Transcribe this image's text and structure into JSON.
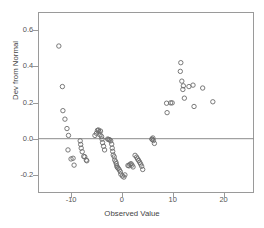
{
  "chart_data": {
    "type": "scatter",
    "title": "",
    "xlabel": "Observed Value",
    "ylabel": "Dev from Normal",
    "xlim": [
      -16.5,
      26.0
    ],
    "ylim": [
      -0.3,
      0.7
    ],
    "xticks": [
      -10,
      0,
      10,
      20
    ],
    "xticklabels": [
      "-10",
      "0",
      "10",
      "20"
    ],
    "yticks": [
      -0.2,
      0.0,
      0.2,
      0.4,
      0.6
    ],
    "yticklabels": [
      "-0.2",
      "0.0",
      "0.2",
      "0.4",
      "0.6"
    ],
    "grid": false,
    "legend": null,
    "reference_lines": [
      {
        "axis": "y",
        "value": 0.0,
        "color": "#8c8c8c"
      }
    ],
    "marker": {
      "shape": "open-circle",
      "radius": 2.2,
      "color": "#6b6b6b"
    },
    "points": [
      {
        "x": -12.4,
        "y": 0.512
      },
      {
        "x": -11.7,
        "y": 0.288
      },
      {
        "x": -11.6,
        "y": 0.155
      },
      {
        "x": -11.2,
        "y": 0.108
      },
      {
        "x": -10.8,
        "y": 0.056
      },
      {
        "x": -10.5,
        "y": 0.018
      },
      {
        "x": -10.6,
        "y": -0.062
      },
      {
        "x": -10.0,
        "y": -0.112
      },
      {
        "x": -9.6,
        "y": -0.108
      },
      {
        "x": -9.4,
        "y": -0.146
      },
      {
        "x": -8.2,
        "y": -0.012
      },
      {
        "x": -8.1,
        "y": -0.032
      },
      {
        "x": -8.0,
        "y": -0.052
      },
      {
        "x": -7.8,
        "y": -0.072
      },
      {
        "x": -7.5,
        "y": -0.098
      },
      {
        "x": -7.3,
        "y": -0.1
      },
      {
        "x": -7.0,
        "y": -0.118
      },
      {
        "x": -6.9,
        "y": -0.122
      },
      {
        "x": -5.3,
        "y": 0.018
      },
      {
        "x": -5.0,
        "y": 0.03
      },
      {
        "x": -4.8,
        "y": 0.046
      },
      {
        "x": -4.6,
        "y": 0.048
      },
      {
        "x": -4.5,
        "y": 0.038
      },
      {
        "x": -4.3,
        "y": 0.022
      },
      {
        "x": -4.2,
        "y": 0.042
      },
      {
        "x": -4.0,
        "y": 0.012
      },
      {
        "x": -3.9,
        "y": -0.002
      },
      {
        "x": -3.8,
        "y": -0.022
      },
      {
        "x": -3.6,
        "y": -0.042
      },
      {
        "x": -3.4,
        "y": -0.062
      },
      {
        "x": -2.8,
        "y": -0.002
      },
      {
        "x": -2.6,
        "y": -0.004
      },
      {
        "x": -2.4,
        "y": -0.006
      },
      {
        "x": -2.2,
        "y": -0.012
      },
      {
        "x": -2.0,
        "y": -0.03
      },
      {
        "x": -1.9,
        "y": -0.052
      },
      {
        "x": -1.8,
        "y": -0.07
      },
      {
        "x": -1.7,
        "y": -0.09
      },
      {
        "x": -1.5,
        "y": -0.1
      },
      {
        "x": -1.4,
        "y": -0.118
      },
      {
        "x": -1.2,
        "y": -0.128
      },
      {
        "x": -1.1,
        "y": -0.138
      },
      {
        "x": -1.0,
        "y": -0.15
      },
      {
        "x": -0.9,
        "y": -0.158
      },
      {
        "x": -0.7,
        "y": -0.164
      },
      {
        "x": -0.5,
        "y": -0.172
      },
      {
        "x": -0.3,
        "y": -0.182
      },
      {
        "x": -0.2,
        "y": -0.196
      },
      {
        "x": 0.1,
        "y": -0.206
      },
      {
        "x": 0.4,
        "y": -0.212
      },
      {
        "x": 0.6,
        "y": -0.2
      },
      {
        "x": 1.2,
        "y": -0.148
      },
      {
        "x": 1.4,
        "y": -0.15
      },
      {
        "x": 1.6,
        "y": -0.142
      },
      {
        "x": 1.8,
        "y": -0.138
      },
      {
        "x": 2.0,
        "y": -0.146
      },
      {
        "x": 2.2,
        "y": -0.156
      },
      {
        "x": 2.6,
        "y": -0.092
      },
      {
        "x": 2.9,
        "y": -0.102
      },
      {
        "x": 3.1,
        "y": -0.112
      },
      {
        "x": 3.3,
        "y": -0.12
      },
      {
        "x": 3.5,
        "y": -0.13
      },
      {
        "x": 3.7,
        "y": -0.14
      },
      {
        "x": 3.9,
        "y": -0.152
      },
      {
        "x": 4.1,
        "y": -0.17
      },
      {
        "x": 5.9,
        "y": -0.002
      },
      {
        "x": 6.0,
        "y": -0.004
      },
      {
        "x": 6.1,
        "y": 0.004
      },
      {
        "x": 6.2,
        "y": -0.01
      },
      {
        "x": 6.4,
        "y": -0.026
      },
      {
        "x": 8.8,
        "y": 0.196
      },
      {
        "x": 8.9,
        "y": 0.144
      },
      {
        "x": 9.6,
        "y": 0.198
      },
      {
        "x": 9.9,
        "y": 0.198
      },
      {
        "x": 11.6,
        "y": 0.42
      },
      {
        "x": 11.5,
        "y": 0.372
      },
      {
        "x": 11.8,
        "y": 0.318
      },
      {
        "x": 12.1,
        "y": 0.292
      },
      {
        "x": 12.0,
        "y": 0.272
      },
      {
        "x": 12.3,
        "y": 0.224
      },
      {
        "x": 13.2,
        "y": 0.288
      },
      {
        "x": 14.0,
        "y": 0.296
      },
      {
        "x": 14.2,
        "y": 0.178
      },
      {
        "x": 15.9,
        "y": 0.28
      },
      {
        "x": 17.9,
        "y": 0.204
      }
    ]
  }
}
